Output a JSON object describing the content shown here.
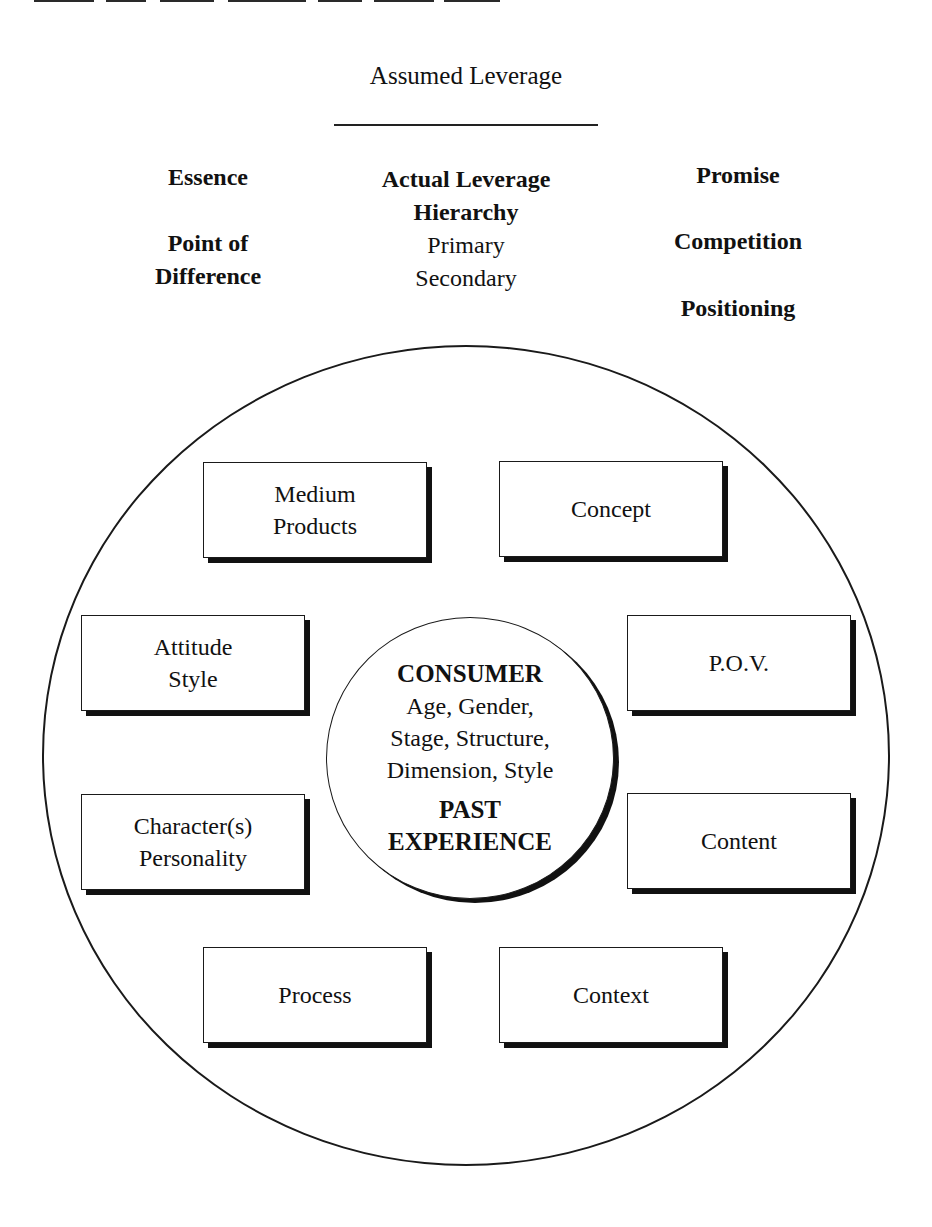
{
  "header": {
    "title": "Assumed Leverage"
  },
  "columns": {
    "left": {
      "items": [
        {
          "label": "Essence",
          "bold": true
        },
        {
          "label": "Point of",
          "bold": true
        },
        {
          "label": "Difference",
          "bold": true
        }
      ]
    },
    "middle": {
      "items": [
        {
          "label": "Actual Leverage",
          "bold": true
        },
        {
          "label": "Hierarchy",
          "bold": true
        },
        {
          "label": "Primary",
          "bold": false
        },
        {
          "label": "Secondary",
          "bold": false
        }
      ]
    },
    "right": {
      "items": [
        {
          "label": "Promise",
          "bold": true
        },
        {
          "label": "Competition",
          "bold": true
        },
        {
          "label": "Positioning",
          "bold": true
        }
      ]
    }
  },
  "boxes": [
    {
      "id": "medium-products",
      "lines": [
        "Medium",
        "Products"
      ]
    },
    {
      "id": "concept",
      "lines": [
        "Concept"
      ]
    },
    {
      "id": "attitude-style",
      "lines": [
        "Attitude",
        "Style"
      ]
    },
    {
      "id": "pov",
      "lines": [
        "P.O.V."
      ]
    },
    {
      "id": "character-personality",
      "lines": [
        "Character(s)",
        "Personality"
      ]
    },
    {
      "id": "content",
      "lines": [
        "Content"
      ]
    },
    {
      "id": "process",
      "lines": [
        "Process"
      ]
    },
    {
      "id": "context",
      "lines": [
        "Context"
      ]
    }
  ],
  "center": {
    "heading": "CONSUMER",
    "lines": [
      "Age, Gender,",
      "Stage, Structure,",
      "Dimension, Style"
    ],
    "footer": [
      "PAST",
      "EXPERIENCE"
    ]
  },
  "colors": {
    "ink": "#111111",
    "background": "#ffffff"
  }
}
